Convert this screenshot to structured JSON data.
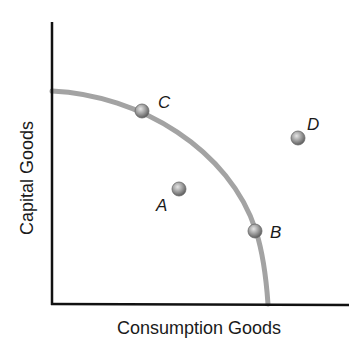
{
  "diagram": {
    "type": "production-possibilities-frontier",
    "x_axis_label": "Consumption Goods",
    "y_axis_label": "Capital Goods",
    "curve_color": "#9a9a9a",
    "axis_color": "#111111",
    "points": [
      {
        "label": "C",
        "position": "on frontier, high capital goods"
      },
      {
        "label": "A",
        "position": "inside frontier"
      },
      {
        "label": "B",
        "position": "on frontier, high consumption goods"
      },
      {
        "label": "D",
        "position": "outside frontier"
      }
    ]
  }
}
